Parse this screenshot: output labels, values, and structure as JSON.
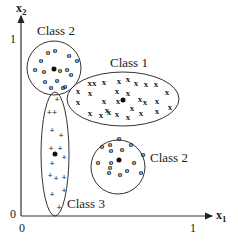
{
  "diagram": {
    "axes": {
      "x_label": "x",
      "x_subscript": "1",
      "y_label": "x",
      "y_subscript": "2",
      "origin_x_tick": "0",
      "origin_y_tick": "0",
      "x_max_tick": "1",
      "y_max_tick": "1"
    },
    "clusters": [
      {
        "label": "Class 2",
        "marker": "o",
        "shape": "circle"
      },
      {
        "label": "Class 1",
        "marker": "x",
        "shape": "ellipse"
      },
      {
        "label": "Class 2",
        "marker": "o",
        "shape": "circle"
      },
      {
        "label": "Class 3",
        "marker": "+",
        "shape": "ellipse"
      }
    ],
    "colors": {
      "stroke": "#333333",
      "text": "#222222",
      "background": "#ffffff"
    }
  }
}
